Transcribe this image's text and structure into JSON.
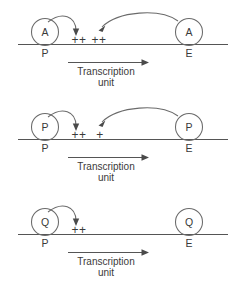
{
  "figure": {
    "width": 244,
    "height": 281,
    "line_color": "#555555",
    "text_color": "#3a3a3a",
    "background": "#ffffff"
  },
  "panels": [
    {
      "id": "panel-1",
      "promoter_factor_label": "A",
      "enhancer_factor_label": "A",
      "promoter_site_label": "P",
      "enhancer_site_label": "E",
      "promoter_plus_label": "++",
      "enhancer_plus_label": "++",
      "transcription_label_line1": "Transcription",
      "transcription_label_line2": "unit",
      "has_promoter_loop_arrow": true,
      "has_enhancer_long_arrow": true
    },
    {
      "id": "panel-2",
      "promoter_factor_label": "P",
      "enhancer_factor_label": "P",
      "promoter_site_label": "P",
      "enhancer_site_label": "E",
      "promoter_plus_label": "++",
      "enhancer_plus_label": "+",
      "transcription_label_line1": "Transcription",
      "transcription_label_line2": "unit",
      "has_promoter_loop_arrow": true,
      "has_enhancer_long_arrow": true
    },
    {
      "id": "panel-3",
      "promoter_factor_label": "Q",
      "enhancer_factor_label": "Q",
      "promoter_site_label": "P",
      "enhancer_site_label": "E",
      "promoter_plus_label": "++",
      "enhancer_plus_label": "",
      "transcription_label_line1": "Transcription",
      "transcription_label_line2": "unit",
      "has_promoter_loop_arrow": true,
      "has_enhancer_long_arrow": false
    }
  ]
}
